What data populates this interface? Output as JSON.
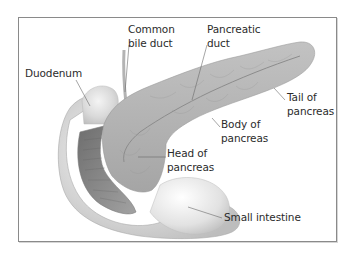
{
  "diagram": {
    "colors": {
      "frame_border": "#8a8a8a",
      "pancreas_fill": "#b4b4b4",
      "intestine_fill": "#d8d8d8",
      "intestine_inner": "#8f8f8f",
      "leader_line": "#6a6a6a",
      "label_text": "#2b2b2b"
    },
    "labels": [
      {
        "id": "common-bile-duct",
        "lines": [
          "Common",
          "bile duct"
        ]
      },
      {
        "id": "pancreatic-duct",
        "lines": [
          "Pancreatic",
          "duct"
        ]
      },
      {
        "id": "duodenum",
        "lines": [
          "Duodenum"
        ]
      },
      {
        "id": "tail-of-pancreas",
        "lines": [
          "Tail of",
          "pancreas"
        ]
      },
      {
        "id": "body-of-pancreas",
        "lines": [
          "Body of",
          "pancreas"
        ]
      },
      {
        "id": "head-of-pancreas",
        "lines": [
          "Head of",
          "pancreas"
        ]
      },
      {
        "id": "small-intestine",
        "lines": [
          "Small intestine"
        ]
      }
    ]
  }
}
